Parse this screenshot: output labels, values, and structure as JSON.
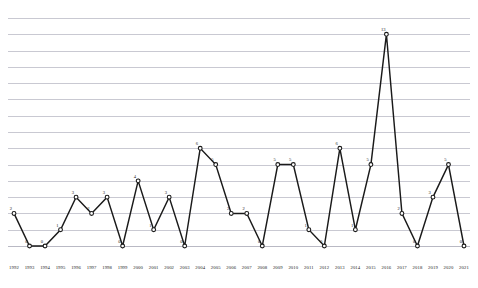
{
  "chart_data": {
    "type": "line",
    "title": "",
    "subtitle": "",
    "xlabel": "",
    "ylabel": "",
    "grid": true,
    "legend": false,
    "show_point_labels": true,
    "ylim": [
      0,
      14
    ],
    "ytick_step": 1,
    "categories": [
      "1992",
      "1993",
      "1994",
      "1995",
      "1996",
      "1997",
      "1998",
      "1999",
      "2000",
      "2001",
      "2002",
      "2003",
      "2004",
      "2005",
      "2006",
      "2007",
      "2008",
      "2009",
      "2010",
      "2011",
      "2012",
      "2013",
      "2014",
      "2015",
      "2016",
      "2017",
      "2018",
      "2019",
      "2020",
      "2021"
    ],
    "values": [
      2,
      0,
      0,
      1,
      3,
      2,
      3,
      0,
      4,
      1,
      3,
      0,
      6,
      5,
      2,
      2,
      0,
      5,
      5,
      1,
      0,
      6,
      1,
      5,
      13,
      2,
      0,
      3,
      5,
      0
    ],
    "series": [
      {
        "name": "count",
        "color": "#1a1a1a",
        "values": [
          2,
          0,
          0,
          1,
          3,
          2,
          3,
          0,
          4,
          1,
          3,
          0,
          6,
          5,
          2,
          2,
          0,
          5,
          5,
          1,
          0,
          6,
          1,
          5,
          13,
          2,
          0,
          3,
          5,
          0
        ]
      }
    ]
  },
  "style": {
    "line_color": "#1a1a1a",
    "marker_fill": "#ffffff",
    "grid_color": "#c9c9d2",
    "background": "#ffffff",
    "label_color": "#1a1a1a"
  }
}
